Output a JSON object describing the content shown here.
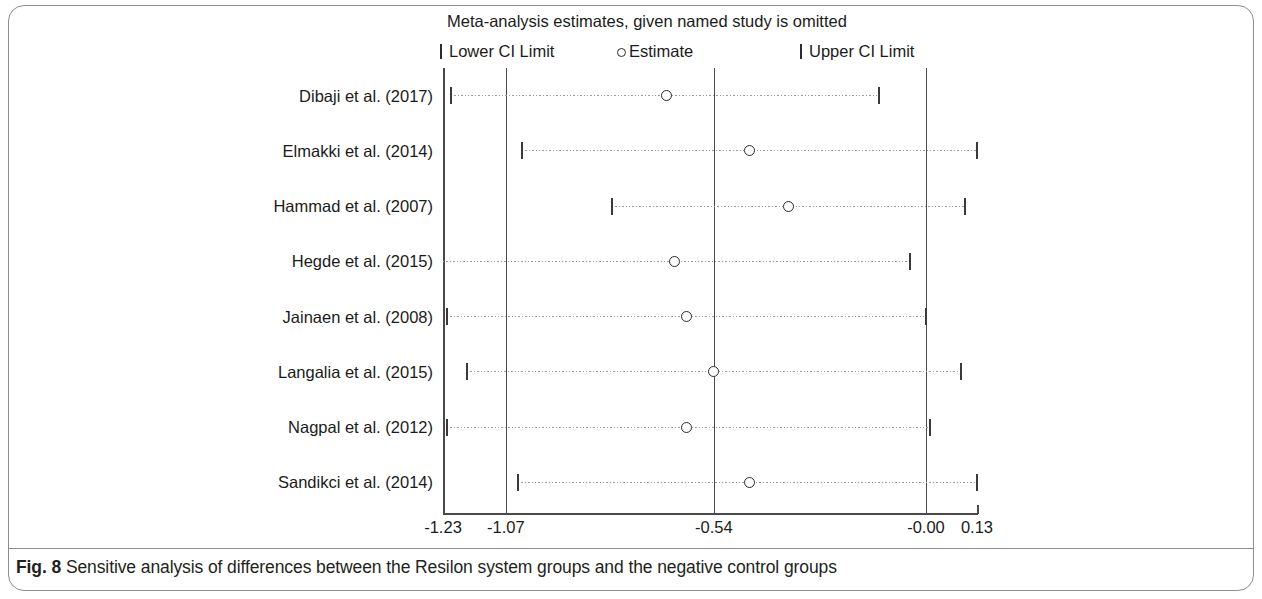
{
  "figure": {
    "label": "Fig. 8",
    "caption": "Sensitive analysis of differences between the Resilon system groups and the negative control groups"
  },
  "chart_data": {
    "type": "scatter",
    "title": "Meta-analysis estimates, given named study is omitted",
    "xlabel": "",
    "ylabel": "",
    "xlim": [
      -1.23,
      0.13
    ],
    "grid": false,
    "legend_position": "top",
    "legend": [
      {
        "key": "lower_ci",
        "marker": "|",
        "label": "Lower CI Limit"
      },
      {
        "key": "estimate",
        "marker": "o",
        "label": "Estimate"
      },
      {
        "key": "upper_ci",
        "marker": "|",
        "label": "Upper CI Limit"
      }
    ],
    "x_ticks": [
      -1.23,
      -1.07,
      -0.54,
      -0.0,
      0.13
    ],
    "x_tick_labels": [
      "-1.23",
      "-1.07",
      "-0.54",
      "-0.00",
      "0.13"
    ],
    "reference_lines": [
      -1.23,
      -1.07,
      -0.54,
      -0.0
    ],
    "categories": [
      "Dibaji et al. (2017)",
      "Elmakki et al. (2014)",
      "Hammad et al.  (2007)",
      "Hegde et al. (2015)",
      "Jainaen et al. (2008)",
      "Langalia et al. (2015)",
      "Nagpal et al. (2012)",
      "Sandikci et al. (2014)"
    ],
    "series": [
      {
        "name": "Lower CI Limit",
        "values": [
          -1.21,
          -1.03,
          -0.8,
          -1.23,
          -1.22,
          -1.17,
          -1.22,
          -1.04
        ]
      },
      {
        "name": "Estimate",
        "values": [
          -0.66,
          -0.45,
          -0.35,
          -0.64,
          -0.61,
          -0.54,
          -0.61,
          -0.45
        ]
      },
      {
        "name": "Upper CI Limit",
        "values": [
          -0.12,
          0.13,
          0.1,
          -0.04,
          0.0,
          0.09,
          0.01,
          0.13
        ]
      }
    ]
  }
}
